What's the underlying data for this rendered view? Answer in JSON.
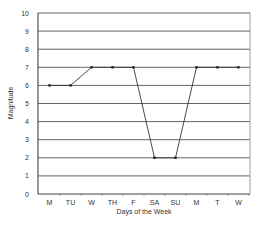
{
  "chart_data": {
    "type": "line",
    "title": "",
    "xlabel": "Days of the Week",
    "ylabel": "Magnitude",
    "categories": [
      "M",
      "TU",
      "W",
      "TH",
      "F",
      "SA",
      "SU",
      "M",
      "T",
      "W"
    ],
    "series": [
      {
        "name": "Magnitude",
        "values": [
          6,
          6,
          7,
          7,
          7,
          2,
          2,
          7,
          7,
          7
        ]
      }
    ],
    "ylim": [
      0,
      10
    ],
    "yticks": [
      0,
      1,
      2,
      3,
      4,
      5,
      6,
      7,
      8,
      9,
      10
    ],
    "grid": true,
    "legend": "none"
  },
  "colors": {
    "line": "#333333",
    "grid": "#555555",
    "axis": "#444444",
    "text": "#333333"
  }
}
